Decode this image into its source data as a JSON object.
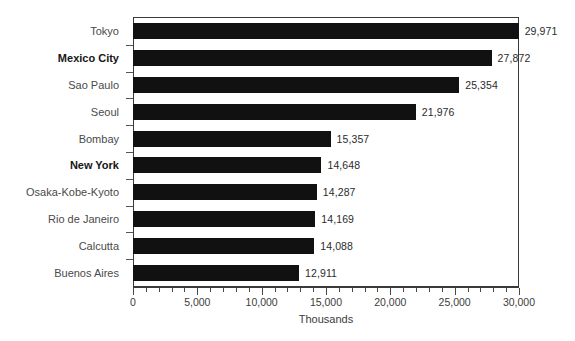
{
  "chart_data": {
    "type": "bar",
    "orientation": "horizontal",
    "title": "",
    "xlabel": "Thousands",
    "ylabel": "",
    "xlim": [
      0,
      30000
    ],
    "x_major_step": 5000,
    "x_minor_step": 1000,
    "grid": false,
    "legend": false,
    "bar_color": "#111111",
    "categories": [
      "Tokyo",
      "Mexico City",
      "Sao Paulo",
      "Seoul",
      "Bombay",
      "New York",
      "Osaka-Kobe-Kyoto",
      "Rio de Janeiro",
      "Calcutta",
      "Buenos Aires"
    ],
    "values": [
      29971,
      27872,
      25354,
      21976,
      15357,
      14648,
      14287,
      14169,
      14088,
      12911
    ],
    "value_labels": [
      "29,971",
      "27,872",
      "25,354",
      "21,976",
      "15,357",
      "14,648",
      "14,287",
      "14,169",
      "14,088",
      "12,911"
    ],
    "emphasized_categories": [
      "Mexico City",
      "New York"
    ],
    "x_tick_labels": [
      "0",
      "5,000",
      "10,000",
      "15,000",
      "20,000",
      "25,000",
      "30,000"
    ],
    "x_tick_values": [
      0,
      5000,
      10000,
      15000,
      20000,
      25000,
      30000
    ]
  }
}
